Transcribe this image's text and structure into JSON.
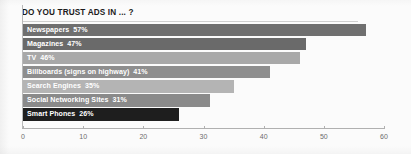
{
  "chart_data": {
    "type": "bar",
    "orientation": "horizontal",
    "title": "DO YOU TRUST ADS IN ... ?",
    "xlabel": "",
    "ylabel": "",
    "xlim": [
      0,
      60
    ],
    "xticks": [
      0,
      10,
      20,
      30,
      40,
      50,
      60
    ],
    "grid": false,
    "legend": false,
    "value_suffix": "%",
    "categories": [
      "Newspapers",
      "Magazines",
      "TV",
      "Billboards (signs on highway)",
      "Search Engines",
      "Social Networking Sites",
      "Smart Phones"
    ],
    "values": [
      57,
      47,
      46,
      41,
      35,
      31,
      26
    ],
    "data_labels": [
      "57%",
      "47%",
      "46%",
      "41%",
      "35%",
      "31%",
      "26%"
    ],
    "bar_colors": [
      "#6f6f6f",
      "#6a6a6a",
      "#a8a8a8",
      "#8e8e8e",
      "#b4b4b4",
      "#8a8a8a",
      "#1e1e1e"
    ],
    "label_color": "#ffffff",
    "axis_color": "#b0b0b0",
    "background": "#fbfbfb"
  },
  "axis": {
    "tick_labels": [
      "0",
      "10",
      "20",
      "30",
      "40",
      "50",
      "60"
    ]
  }
}
